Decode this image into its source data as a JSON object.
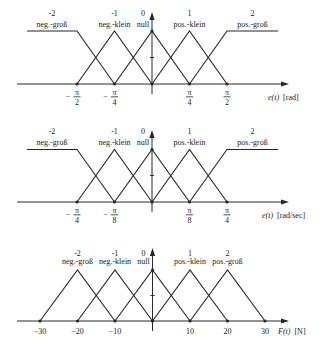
{
  "chart_data": [
    {
      "type": "line",
      "title": "",
      "xlabel": "e(t) [rad]",
      "xlabel_var": "e(t)",
      "xlabel_unit": "[rad]",
      "ylabel": "",
      "ylim": [
        0,
        1
      ],
      "y_ticks": [
        0,
        0.5,
        1
      ],
      "grid": false,
      "legend": "term labels above each peak",
      "x_ticks": [
        {
          "value": -1.571,
          "label": "−π/2",
          "sign": "−",
          "num": "π",
          "den": "2"
        },
        {
          "value": -0.785,
          "label": "−π/4",
          "sign": "−",
          "num": "π",
          "den": "4"
        },
        {
          "value": 0.785,
          "label": "π/4",
          "sign": "",
          "num": "π",
          "den": "4"
        },
        {
          "value": 1.571,
          "label": "π/2",
          "sign": "",
          "num": "π",
          "den": "2"
        }
      ],
      "series": [
        {
          "index": "-2",
          "name": "neg.-groß",
          "x": [
            -2.62,
            -1.571,
            -0.785
          ],
          "y": [
            1,
            1,
            0
          ]
        },
        {
          "index": "-1",
          "name": "neg.-klein",
          "x": [
            -1.571,
            -0.785,
            0
          ],
          "y": [
            0,
            1,
            0
          ]
        },
        {
          "index": "0",
          "name": "null",
          "x": [
            -0.785,
            0,
            0.785
          ],
          "y": [
            0,
            1,
            0
          ]
        },
        {
          "index": "1",
          "name": "pos.-klein",
          "x": [
            0,
            0.785,
            1.571
          ],
          "y": [
            0,
            1,
            0
          ]
        },
        {
          "index": "2",
          "name": "pos.-groß",
          "x": [
            0.785,
            1.571,
            2.64
          ],
          "y": [
            0,
            1,
            1
          ]
        }
      ]
    },
    {
      "type": "line",
      "title": "",
      "xlabel": "e(t) [rad/sec]",
      "xlabel_var": "e(t)",
      "xlabel_unit": "[rad/sec]",
      "ylabel": "",
      "ylim": [
        0,
        1
      ],
      "y_ticks": [
        0,
        0.5,
        1
      ],
      "grid": false,
      "legend": "term labels above each peak",
      "x_ticks": [
        {
          "value": -0.785,
          "label": "−π/4",
          "sign": "−",
          "num": "π",
          "den": "4"
        },
        {
          "value": -0.393,
          "label": "−π/8",
          "sign": "−",
          "num": "π",
          "den": "8"
        },
        {
          "value": 0.393,
          "label": "π/8",
          "sign": "",
          "num": "π",
          "den": "8"
        },
        {
          "value": 0.785,
          "label": "π/4",
          "sign": "",
          "num": "π",
          "den": "4"
        }
      ],
      "series": [
        {
          "index": "-2",
          "name": "neg.-groß",
          "x": [
            -1.31,
            -0.785,
            -0.393
          ],
          "y": [
            1,
            1,
            0
          ]
        },
        {
          "index": "-1",
          "name": "neg.-klein",
          "x": [
            -0.785,
            -0.393,
            0
          ],
          "y": [
            0,
            1,
            0
          ]
        },
        {
          "index": "0",
          "name": "null",
          "x": [
            -0.393,
            0,
            0.393
          ],
          "y": [
            0,
            1,
            0
          ]
        },
        {
          "index": "1",
          "name": "pos.-klein",
          "x": [
            0,
            0.393,
            0.785
          ],
          "y": [
            0,
            1,
            0
          ]
        },
        {
          "index": "2",
          "name": "pos.-groß",
          "x": [
            0.393,
            0.785,
            1.32
          ],
          "y": [
            0,
            1,
            1
          ]
        }
      ]
    },
    {
      "type": "line",
      "title": "",
      "xlabel": "F(t) [N]",
      "xlabel_var": "F(t)",
      "xlabel_unit": "[N]",
      "ylabel": "",
      "ylim": [
        0,
        1
      ],
      "y_ticks": [
        0,
        0.5,
        1
      ],
      "grid": false,
      "legend": "term labels above each peak",
      "x_ticks": [
        {
          "value": -30,
          "label": "−30"
        },
        {
          "value": -20,
          "label": "−20"
        },
        {
          "value": -10,
          "label": "−10"
        },
        {
          "value": 10,
          "label": "10"
        },
        {
          "value": 20,
          "label": "20"
        },
        {
          "value": 30,
          "label": "30"
        }
      ],
      "series": [
        {
          "index": "-2",
          "name": "neg.-groß",
          "x": [
            -30,
            -20,
            -10
          ],
          "y": [
            0,
            1,
            0
          ]
        },
        {
          "index": "-1",
          "name": "neg.-klein",
          "x": [
            -20,
            -10,
            0
          ],
          "y": [
            0,
            1,
            0
          ]
        },
        {
          "index": "0",
          "name": "null",
          "x": [
            -10,
            0,
            10
          ],
          "y": [
            0,
            1,
            0
          ]
        },
        {
          "index": "1",
          "name": "pos.-klein",
          "x": [
            0,
            10,
            20
          ],
          "y": [
            0,
            1,
            0
          ]
        },
        {
          "index": "2",
          "name": "pos.-groß",
          "x": [
            10,
            20,
            30
          ],
          "y": [
            0,
            1,
            0
          ]
        }
      ]
    }
  ]
}
